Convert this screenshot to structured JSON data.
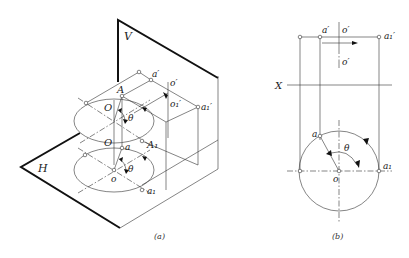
{
  "figure_a": {
    "caption": "(a)",
    "plane_v": "V",
    "plane_h": "H",
    "labels": {
      "a_prime": "a′",
      "o_prime": "o′",
      "o1_prime": "o₁′",
      "a1_prime": "a₁′",
      "A": "A",
      "O_upper": "O",
      "theta_upper": "θ",
      "O_lower": "O",
      "A1": "A₁",
      "a": "a",
      "o": "o",
      "theta_lower": "θ",
      "a1": "a₁"
    }
  },
  "figure_b": {
    "caption": "(b)",
    "axis": "X",
    "labels": {
      "a_prime": "a′",
      "o_prime_top": "o′",
      "o_prime_bottom": "o′",
      "a1_prime": "a₁′",
      "a": "a",
      "theta": "θ",
      "o": "o",
      "a1": "a₁"
    }
  }
}
